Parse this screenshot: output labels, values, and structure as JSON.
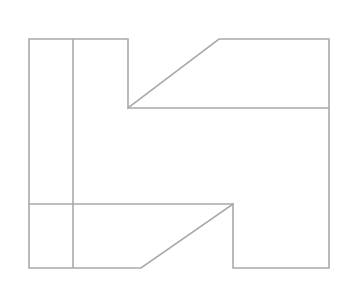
{
  "diagram": {
    "width": 352,
    "height": 283,
    "background": "#ffffff",
    "stroke_color": "#a9a9a9",
    "stroke_width": 1.6,
    "outline": [
      [
        29,
        39
      ],
      [
        128,
        39
      ],
      [
        128,
        108
      ],
      [
        219,
        39
      ],
      [
        329,
        39
      ],
      [
        329,
        268
      ],
      [
        233,
        268
      ],
      [
        233,
        204
      ],
      [
        141,
        268
      ],
      [
        29,
        268
      ]
    ],
    "lines": [
      {
        "name": "inner-vertical-line",
        "points": [
          [
            73,
            39
          ],
          [
            73,
            268
          ]
        ]
      },
      {
        "name": "upper-horizontal-line",
        "points": [
          [
            128,
            108
          ],
          [
            329,
            108
          ]
        ]
      },
      {
        "name": "lower-horizontal-line",
        "points": [
          [
            29,
            204
          ],
          [
            233,
            204
          ]
        ]
      }
    ]
  }
}
